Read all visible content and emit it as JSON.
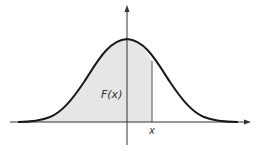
{
  "diagram": {
    "type": "normal-distribution-cdf-illustration",
    "area_label": "F(x)",
    "x_marker_label": "x",
    "colors": {
      "curve": "#1a1a1a",
      "shaded_area": "#e6e6e6",
      "axes": "#333333",
      "background": "#ffffff"
    }
  }
}
